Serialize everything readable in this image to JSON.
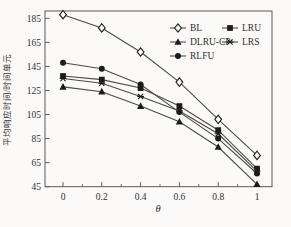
{
  "figure": {
    "background": "#fbfaf8",
    "plot_border_color": "#5a5a5a",
    "line_color": "#4b4b4b",
    "marker_color": "#1c1c1c",
    "text_color": "#2f2f2f"
  },
  "chart_data": {
    "type": "line",
    "title": "",
    "xlabel": "θ",
    "ylabel": "平均响应时间/时间单元",
    "x": [
      0,
      0.2,
      0.4,
      0.6,
      0.8,
      1
    ],
    "x_tick_labels": [
      "0",
      "0.2",
      "0.4",
      "0.6",
      "0.8",
      "1"
    ],
    "y_tick_values": [
      185,
      165,
      145,
      125,
      105,
      85,
      65,
      45
    ],
    "y_tick_labels": [
      "185",
      "165",
      "145",
      "125",
      "105",
      "85",
      "65",
      "45"
    ],
    "xlim": [
      -0.093,
      1.077
    ],
    "ylim": [
      45,
      191
    ],
    "grid": false,
    "legend_position": "upper-right-inside",
    "series": [
      {
        "name": "BL",
        "marker": "open-diamond",
        "values": [
          188,
          177,
          157,
          132,
          101,
          71
        ]
      },
      {
        "name": "LRU",
        "marker": "filled-square",
        "values": [
          137,
          134,
          127,
          112,
          92,
          60
        ]
      },
      {
        "name": "DLRU-CP",
        "marker": "filled-triangle",
        "values": [
          128,
          124,
          112,
          99,
          78,
          47
        ]
      },
      {
        "name": "LRS",
        "marker": "asterisk",
        "values": [
          135,
          131,
          120,
          108,
          89,
          58
        ]
      },
      {
        "name": "RLFU",
        "marker": "filled-circle",
        "values": [
          148,
          143,
          130,
          107,
          85,
          56
        ]
      }
    ]
  },
  "legend": {
    "columns": [
      [
        "BL",
        "DLRU-CP",
        "RLFU"
      ],
      [
        "LRU",
        "LRS"
      ]
    ]
  }
}
